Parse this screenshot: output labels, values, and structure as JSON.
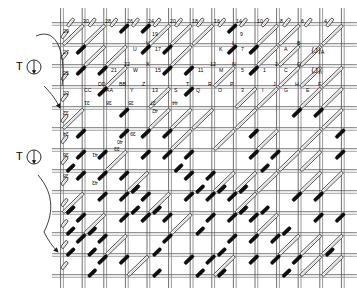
{
  "figure": {
    "canvas": {
      "width": 357,
      "height": 294
    },
    "grid": {
      "left": 62,
      "top": 24,
      "cell_width": 21.6,
      "cell_height": 21.0,
      "columns": 13,
      "rows": 12,
      "line_color": "#555555",
      "rail_color": "#8a8a8a"
    },
    "bar": {
      "open_fill": "#ffffff",
      "open_stroke": "#222222",
      "solid_fill": "#0d0d0d",
      "solid_stroke": "#000000"
    }
  },
  "terminals": [
    {
      "name": "terminal-upper",
      "label": "T",
      "symbol": "circle-with-vertical-line",
      "x": 16,
      "y": 58
    },
    {
      "name": "terminal-lower",
      "label": "T",
      "symbol": "circle-with-vertical-line",
      "x": 16,
      "y": 148
    }
  ],
  "arrows": [
    {
      "name": "arrow-upper",
      "from": "terminal-upper",
      "to": "grid-row-4-left"
    },
    {
      "name": "arrow-lower",
      "from": "terminal-lower",
      "to": "grid-row-8-left"
    }
  ],
  "side_annotations": [
    {
      "name": "annotation-J-A",
      "text": "⟨J⟩",
      "sub": "A",
      "x": 311,
      "y": 46
    },
    {
      "name": "annotation-J-i",
      "text": "⟨J⟩",
      "sub": "i",
      "x": 311,
      "y": 66
    }
  ],
  "top_numbers": [
    {
      "text": "30",
      "x": 83,
      "y": 19
    },
    {
      "text": "28",
      "x": 105,
      "y": 19
    },
    {
      "text": "26",
      "x": 127,
      "y": 19
    },
    {
      "text": "24",
      "x": 148,
      "y": 19
    },
    {
      "text": "20",
      "x": 170,
      "y": 19
    },
    {
      "text": "18",
      "x": 192,
      "y": 19
    },
    {
      "text": "16",
      "x": 214,
      "y": 19
    },
    {
      "text": "14",
      "x": 236,
      "y": 19
    },
    {
      "text": "10",
      "x": 257,
      "y": 19
    },
    {
      "text": "8",
      "x": 280,
      "y": 19
    },
    {
      "text": "6",
      "x": 301,
      "y": 19
    },
    {
      "text": "4",
      "x": 324,
      "y": 19
    }
  ],
  "labels": [
    {
      "text": "29",
      "x": 63,
      "y": 29,
      "flip": false
    },
    {
      "text": "19",
      "x": 152,
      "y": 32,
      "flip": false
    },
    {
      "text": "9",
      "x": 240,
      "y": 32,
      "flip": false
    },
    {
      "text": "27",
      "x": 63,
      "y": 50,
      "flip": false
    },
    {
      "text": "U",
      "x": 133,
      "y": 47,
      "flip": false
    },
    {
      "text": "V",
      "x": 146,
      "y": 41,
      "flip": false
    },
    {
      "text": "17",
      "x": 155,
      "y": 47,
      "flip": false
    },
    {
      "text": "K",
      "x": 219,
      "y": 47,
      "flip": false
    },
    {
      "text": "L",
      "x": 232,
      "y": 41,
      "flip": false
    },
    {
      "text": "7",
      "x": 241,
      "y": 47,
      "flip": false
    },
    {
      "text": "A",
      "x": 284,
      "y": 47,
      "flip": false
    },
    {
      "text": "B",
      "x": 297,
      "y": 41,
      "flip": false
    },
    {
      "text": "25",
      "x": 63,
      "y": 71,
      "flip": false
    },
    {
      "text": "21",
      "x": 111,
      "y": 68,
      "flip": false
    },
    {
      "text": "22",
      "x": 124,
      "y": 62,
      "flip": false
    },
    {
      "text": "W",
      "x": 133,
      "y": 68,
      "flip": false
    },
    {
      "text": "X",
      "x": 146,
      "y": 62,
      "flip": false
    },
    {
      "text": "15",
      "x": 155,
      "y": 68,
      "flip": false
    },
    {
      "text": "11",
      "x": 198,
      "y": 68,
      "flip": false
    },
    {
      "text": "12",
      "x": 210,
      "y": 62,
      "flip": false
    },
    {
      "text": "M",
      "x": 219,
      "y": 68,
      "flip": false
    },
    {
      "text": "N",
      "x": 232,
      "y": 62,
      "flip": false
    },
    {
      "text": "5",
      "x": 241,
      "y": 68,
      "flip": false
    },
    {
      "text": "1",
      "x": 263,
      "y": 68,
      "flip": false
    },
    {
      "text": "2",
      "x": 275,
      "y": 62,
      "flip": false
    },
    {
      "text": "C",
      "x": 284,
      "y": 68,
      "flip": false
    },
    {
      "text": "Q",
      "x": 297,
      "y": 62,
      "flip": false
    },
    {
      "text": "23",
      "x": 63,
      "y": 91,
      "flip": false
    },
    {
      "text": "CC",
      "x": 84,
      "y": 88,
      "flip": false
    },
    {
      "text": "DD",
      "x": 98,
      "y": 82,
      "flip": false
    },
    {
      "text": "AA",
      "x": 106,
      "y": 88,
      "flip": false
    },
    {
      "text": "BB",
      "x": 119,
      "y": 82,
      "flip": false
    },
    {
      "text": "Y",
      "x": 130,
      "y": 88,
      "flip": false
    },
    {
      "text": "Z",
      "x": 142,
      "y": 82,
      "flip": false
    },
    {
      "text": "13",
      "x": 152,
      "y": 88,
      "flip": false
    },
    {
      "text": "S",
      "x": 174,
      "y": 88,
      "flip": false
    },
    {
      "text": "T",
      "x": 186,
      "y": 82,
      "flip": false
    },
    {
      "text": "Q",
      "x": 196,
      "y": 88,
      "flip": false
    },
    {
      "text": "R",
      "x": 208,
      "y": 82,
      "flip": false
    },
    {
      "text": "O",
      "x": 218,
      "y": 88,
      "flip": false
    },
    {
      "text": "P",
      "x": 230,
      "y": 82,
      "flip": false
    },
    {
      "text": "3",
      "x": 241,
      "y": 88,
      "flip": false
    },
    {
      "text": "I",
      "x": 262,
      "y": 88,
      "flip": false
    },
    {
      "text": "J",
      "x": 273,
      "y": 82,
      "flip": false
    },
    {
      "text": "G",
      "x": 284,
      "y": 88,
      "flip": false
    },
    {
      "text": "H",
      "x": 295,
      "y": 82,
      "flip": false
    },
    {
      "text": "E",
      "x": 306,
      "y": 88,
      "flip": false
    },
    {
      "text": "F",
      "x": 318,
      "y": 82,
      "flip": false
    },
    {
      "text": "31",
      "x": 84,
      "y": 100,
      "flip": true
    },
    {
      "text": "38",
      "x": 106,
      "y": 100,
      "flip": true
    },
    {
      "text": "35",
      "x": 128,
      "y": 100,
      "flip": true
    },
    {
      "text": "37",
      "x": 150,
      "y": 100,
      "flip": true
    },
    {
      "text": "44",
      "x": 172,
      "y": 100,
      "flip": true
    },
    {
      "text": "42",
      "x": 152,
      "y": 108,
      "flip": true
    },
    {
      "text": "32",
      "x": 63,
      "y": 110,
      "flip": true
    },
    {
      "text": "34",
      "x": 63,
      "y": 131,
      "flip": true
    },
    {
      "text": "39",
      "x": 130,
      "y": 131,
      "flip": true
    },
    {
      "text": "40",
      "x": 117,
      "y": 139,
      "flip": true
    },
    {
      "text": "33",
      "x": 114,
      "y": 146,
      "flip": true
    },
    {
      "text": "41",
      "x": 92,
      "y": 152,
      "flip": true
    },
    {
      "text": "36",
      "x": 63,
      "y": 152,
      "flip": true
    },
    {
      "text": "38",
      "x": 63,
      "y": 173,
      "flip": true
    },
    {
      "text": "43",
      "x": 92,
      "y": 180,
      "flip": true
    }
  ],
  "bars": {
    "legend": {
      "open": "open diagonal connector (unfilled)",
      "solid": "solid diagonal connector (filled black)"
    },
    "open_count": 96,
    "solid_count": 88
  }
}
